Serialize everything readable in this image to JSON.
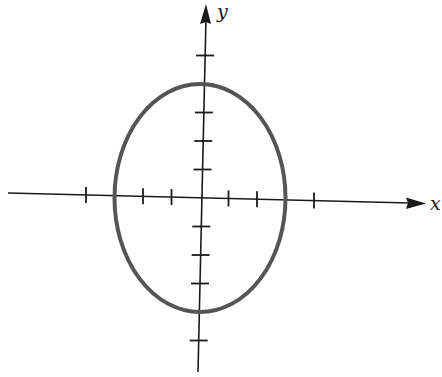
{
  "diagram": {
    "type": "ellipse-on-axes",
    "colors": {
      "axis": "#1a1a1a",
      "ellipse": "#555555",
      "background": "#ffffff"
    },
    "axes": {
      "x_label": "x",
      "y_label": "y",
      "x_ticks": [
        -4,
        -3,
        -2,
        -1,
        1,
        2,
        3,
        4
      ],
      "y_ticks": [
        -5,
        -4,
        -3,
        -2,
        -1,
        1,
        2,
        3,
        4,
        5
      ]
    },
    "ellipse": {
      "center": [
        0,
        0
      ],
      "semi_x": 3,
      "semi_y": 4
    }
  }
}
